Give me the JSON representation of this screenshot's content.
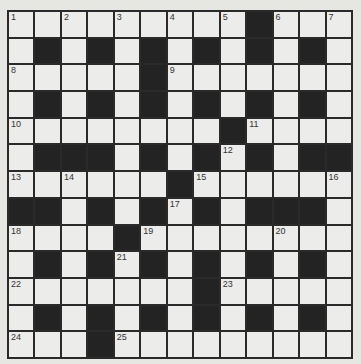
{
  "puzzle": {
    "rows": 13,
    "cols": 13,
    "colors": {
      "background": "#e6e6e3",
      "cell": "#ececea",
      "block": "#232323",
      "line": "#2a2a2a"
    },
    "grid": [
      [
        "1",
        "",
        "2",
        "",
        "3",
        "",
        "4",
        "",
        "5",
        "#",
        "6",
        "",
        "7"
      ],
      [
        "",
        "#",
        "",
        "#",
        "",
        "#",
        "",
        "#",
        "",
        "#",
        "",
        "#",
        ""
      ],
      [
        "8",
        "",
        "",
        "",
        "",
        "#",
        "9",
        "",
        "",
        "",
        "",
        "",
        ""
      ],
      [
        "",
        "#",
        "",
        "#",
        "",
        "#",
        "",
        "#",
        "",
        "#",
        "",
        "#",
        ""
      ],
      [
        "10",
        "",
        "",
        "",
        "",
        "",
        "",
        "",
        "#",
        "11",
        "",
        "",
        ""
      ],
      [
        "",
        "#",
        "#",
        "#",
        "",
        "#",
        "",
        "#",
        "12",
        "#",
        "",
        "#",
        "#"
      ],
      [
        "13",
        "",
        "14",
        "",
        "",
        "",
        "#",
        "15",
        "",
        "",
        "",
        "",
        "16"
      ],
      [
        "#",
        "#",
        "",
        "#",
        "",
        "#",
        "17",
        "#",
        "",
        "#",
        "#",
        "#",
        ""
      ],
      [
        "18",
        "",
        "",
        "",
        "#",
        "19",
        "",
        "",
        "",
        "",
        "20",
        "",
        ""
      ],
      [
        "",
        "#",
        "",
        "#",
        "21",
        "#",
        "",
        "#",
        "",
        "#",
        "",
        "#",
        ""
      ],
      [
        "22",
        "",
        "",
        "",
        "",
        "",
        "",
        "#",
        "23",
        "",
        "",
        "",
        ""
      ],
      [
        "",
        "#",
        "",
        "#",
        "",
        "#",
        "",
        "#",
        "",
        "#",
        "",
        "#",
        ""
      ],
      [
        "24",
        "",
        "",
        "#",
        "25",
        "",
        "",
        "",
        "",
        "",
        "",
        "",
        ""
      ]
    ]
  }
}
